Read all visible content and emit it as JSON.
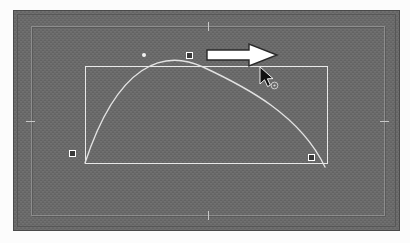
{
  "app": {
    "title": "Canvas Transform Selection",
    "view_label": "artboard"
  },
  "canvas": {
    "background_label": "transparent-checkerboard",
    "background_color": "#6f6f6f",
    "checker_color": "#656565",
    "frame_border_color": "#8d8d8d",
    "edge_border_color": "#4a4a4a"
  },
  "frame": {
    "label": "image frame",
    "ticks": [
      {
        "name": "tick-top",
        "position": "top-center"
      },
      {
        "name": "tick-bottom",
        "position": "bottom-center"
      },
      {
        "name": "tick-left",
        "position": "left-middle"
      },
      {
        "name": "tick-right",
        "position": "right-middle"
      }
    ]
  },
  "selection": {
    "label": "transform bounding box",
    "stroke_color": "#e8e8e8",
    "x": 84,
    "y": 65,
    "width": 243,
    "height": 98,
    "handles": [
      {
        "name": "handle-bottom-left",
        "label": "bottom-left anchor",
        "x": 71,
        "y": 152
      },
      {
        "name": "handle-bottom-right",
        "label": "bottom-right anchor",
        "x": 310,
        "y": 156
      },
      {
        "name": "handle-top-center",
        "label": "top-center anchor",
        "x": 188,
        "y": 54
      }
    ],
    "point_marker": {
      "name": "point-dot",
      "label": "path point",
      "x": 143,
      "y": 54
    }
  },
  "curve": {
    "label": "bezier arc",
    "stroke_color": "#e2e2e2",
    "stroke_width": 1.4,
    "start": {
      "x": 71,
      "y": 152
    },
    "end": {
      "x": 311,
      "y": 156
    },
    "apex": {
      "x": 189,
      "y": 56
    },
    "control_1": {
      "x": 110,
      "y": 48
    },
    "control_2": {
      "x": 275,
      "y": 50
    },
    "path": "M 71 152 C 104 52, 150 38, 189 56 C 232 76, 286 104, 311 156"
  },
  "annotation": {
    "arrow": {
      "name": "drag-direction-arrow",
      "label": "drag right",
      "direction": "right",
      "fill_color": "#ffffff",
      "outline_color": "#2a2a2a",
      "x": 206,
      "y": 42,
      "width": 74,
      "height": 26
    }
  },
  "cursor": {
    "name": "mouse-pointer",
    "label": "arrow pointer with move badge",
    "fill_color": "#111111",
    "outline_color": "#ffffff",
    "badge": "circle",
    "x": 258,
    "y": 66
  }
}
